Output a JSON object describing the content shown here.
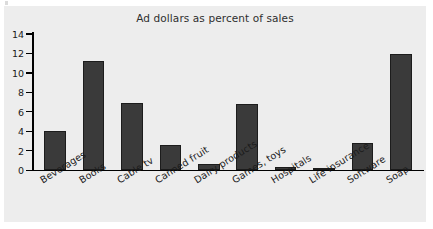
{
  "chart_data": {
    "type": "bar",
    "title": "Ad dollars as percent of sales",
    "xlabel": "",
    "ylabel": "",
    "ylim": [
      0,
      14
    ],
    "yticks": [
      0,
      2,
      4,
      6,
      8,
      10,
      12,
      14
    ],
    "grid": false,
    "legend": null,
    "categories": [
      "Beverages",
      "Books",
      "Cable tv",
      "Canned fruit",
      "Dairy products",
      "Games, toys",
      "Hospitals",
      "Life insurance",
      "Software",
      "Soap"
    ],
    "values": [
      4.0,
      11.2,
      6.9,
      2.6,
      0.6,
      6.8,
      0.35,
      0.15,
      2.75,
      11.9
    ],
    "bar_color": "#3a3a3a",
    "panel_color": "#ededed",
    "axis_color": "#000000"
  }
}
